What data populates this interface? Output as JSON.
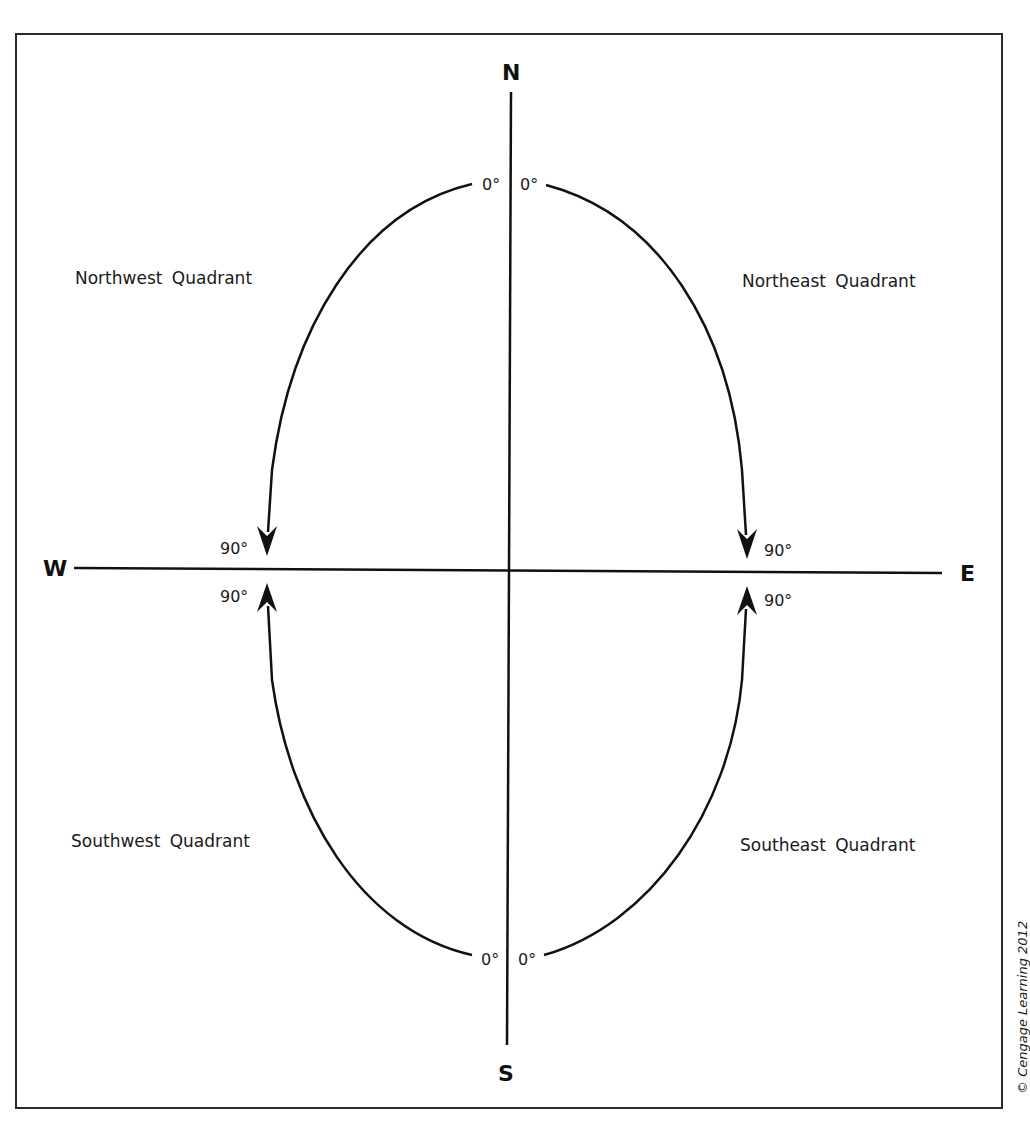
{
  "figure": {
    "copyright": "© Cengage Learning 2012"
  },
  "cardinals": {
    "north": "N",
    "south": "S",
    "east": "E",
    "west": "W"
  },
  "quadrants": {
    "northwest": "Northwest  Quadrant",
    "northeast": "Northeast  Quadrant",
    "southwest": "Southwest  Quadrant",
    "southeast": "Southeast Quadrant"
  },
  "degree_labels": {
    "north_left": "0°",
    "north_right": "0°",
    "south_left": "0°",
    "south_right": "0°",
    "west_upper": "90°",
    "west_lower": "90°",
    "east_upper": "90°",
    "east_lower": "90°"
  },
  "arrows": [
    {
      "quadrant": "northwest",
      "from": "0° at N",
      "to": "90° at W",
      "direction": "down"
    },
    {
      "quadrant": "northeast",
      "from": "0° at N",
      "to": "90° at E",
      "direction": "down"
    },
    {
      "quadrant": "southwest",
      "from": "0° at S",
      "to": "90° at W",
      "direction": "up"
    },
    {
      "quadrant": "southeast",
      "from": "0° at S",
      "to": "90° at E",
      "direction": "up"
    }
  ],
  "colors": {
    "line": "#111111",
    "frame": "#2a2a2a",
    "background": "#ffffff"
  }
}
